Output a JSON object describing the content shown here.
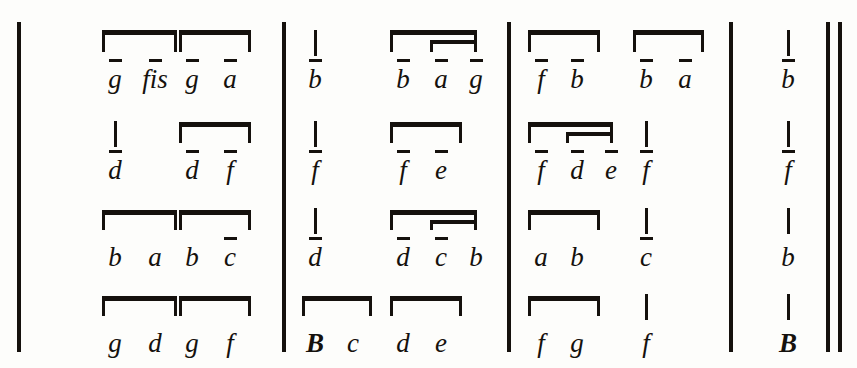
{
  "document": {
    "type": "music-notation-letter-tablature",
    "description": "Four-voice letter notation in four measures plus closing measure, with beam groups and octave strokes",
    "ink_color": "#15110d",
    "page_color": "#fdfdfb"
  },
  "barlines": [
    {
      "name": "opening-barline",
      "x": 17,
      "top": 22,
      "height": 330,
      "width": 4
    },
    {
      "name": "barline-1",
      "x": 282,
      "top": 22,
      "height": 330,
      "width": 4
    },
    {
      "name": "barline-2",
      "x": 507,
      "top": 22,
      "height": 330,
      "width": 4
    },
    {
      "name": "barline-3",
      "x": 729,
      "top": 22,
      "height": 330,
      "width": 4
    },
    {
      "name": "final-barline-a",
      "x": 826,
      "top": 22,
      "height": 330,
      "width": 4
    },
    {
      "name": "final-barline-b",
      "x": 838,
      "top": 22,
      "height": 330,
      "width": 4
    }
  ],
  "voices": [
    {
      "name": "voice-1",
      "baseline": 88,
      "notes": [
        {
          "letter": "g",
          "x": 95,
          "octave": true,
          "stem": true
        },
        {
          "letter": "fis",
          "x": 135,
          "octave": true,
          "stem": true
        },
        {
          "letter": "g",
          "x": 172,
          "octave": true,
          "stem": true
        },
        {
          "letter": "a",
          "x": 210,
          "octave": true,
          "stem": true
        },
        {
          "letter": "b",
          "x": 295,
          "octave": true,
          "stem": true
        },
        {
          "letter": "b",
          "x": 383,
          "octave": true,
          "stem": true
        },
        {
          "letter": "a",
          "x": 421,
          "octave": true,
          "stem": true
        },
        {
          "letter": "g",
          "x": 456,
          "octave": true,
          "stem": true
        },
        {
          "letter": "f",
          "x": 521,
          "octave": true,
          "stem": true
        },
        {
          "letter": "b",
          "x": 557,
          "octave": true,
          "stem": true
        },
        {
          "letter": "b",
          "x": 626,
          "octave": true,
          "stem": true
        },
        {
          "letter": "a",
          "x": 665,
          "octave": true,
          "stem": true
        },
        {
          "letter": "b",
          "x": 768,
          "octave": true,
          "stem": true
        }
      ],
      "beams": [
        {
          "x": 102,
          "width": 75,
          "y": 30,
          "level": 1
        },
        {
          "x": 179,
          "width": 72,
          "y": 30,
          "level": 1
        },
        {
          "x": 390,
          "width": 87,
          "y": 30,
          "level": 1
        },
        {
          "x": 430,
          "width": 47,
          "y": 40,
          "level": 2
        },
        {
          "x": 528,
          "width": 72,
          "y": 30,
          "level": 1
        },
        {
          "x": 633,
          "width": 71,
          "y": 30,
          "level": 1
        }
      ]
    },
    {
      "name": "voice-2",
      "baseline": 179,
      "notes": [
        {
          "letter": "d",
          "x": 95,
          "octave": true,
          "stem": true
        },
        {
          "letter": "d",
          "x": 172,
          "octave": true,
          "stem": true
        },
        {
          "letter": "f",
          "x": 210,
          "octave": true,
          "stem": true
        },
        {
          "letter": "f",
          "x": 295,
          "octave": true,
          "stem": true
        },
        {
          "letter": "f",
          "x": 383,
          "octave": true,
          "stem": true
        },
        {
          "letter": "e",
          "x": 421,
          "octave": true,
          "stem": true
        },
        {
          "letter": "f",
          "x": 521,
          "octave": true,
          "stem": true
        },
        {
          "letter": "d",
          "x": 557,
          "octave": true,
          "stem": true
        },
        {
          "letter": "e",
          "x": 591,
          "octave": true,
          "stem": true
        },
        {
          "letter": "f",
          "x": 626,
          "octave": true,
          "stem": true
        },
        {
          "letter": "f",
          "x": 768,
          "octave": true,
          "stem": true
        }
      ],
      "beams": [
        {
          "x": 179,
          "width": 72,
          "y": 122,
          "level": 1
        },
        {
          "x": 390,
          "width": 72,
          "y": 122,
          "level": 1
        },
        {
          "x": 528,
          "width": 85,
          "y": 122,
          "level": 1
        },
        {
          "x": 566,
          "width": 47,
          "y": 132,
          "level": 2
        }
      ]
    },
    {
      "name": "voice-3",
      "baseline": 266,
      "notes": [
        {
          "letter": "b",
          "x": 95,
          "octave": false,
          "stem": true
        },
        {
          "letter": "a",
          "x": 135,
          "octave": false,
          "stem": true
        },
        {
          "letter": "b",
          "x": 172,
          "octave": false,
          "stem": true
        },
        {
          "letter": "c",
          "x": 210,
          "octave": true,
          "stem": true
        },
        {
          "letter": "d",
          "x": 295,
          "octave": true,
          "stem": true
        },
        {
          "letter": "d",
          "x": 383,
          "octave": true,
          "stem": true
        },
        {
          "letter": "c",
          "x": 421,
          "octave": true,
          "stem": true
        },
        {
          "letter": "b",
          "x": 456,
          "octave": false,
          "stem": true
        },
        {
          "letter": "a",
          "x": 521,
          "octave": false,
          "stem": true
        },
        {
          "letter": "b",
          "x": 557,
          "octave": false,
          "stem": true
        },
        {
          "letter": "c",
          "x": 626,
          "octave": true,
          "stem": true
        },
        {
          "letter": "b",
          "x": 768,
          "octave": false,
          "stem": true
        }
      ],
      "beams": [
        {
          "x": 102,
          "width": 75,
          "y": 210,
          "level": 1
        },
        {
          "x": 179,
          "width": 72,
          "y": 210,
          "level": 1
        },
        {
          "x": 390,
          "width": 87,
          "y": 210,
          "level": 1
        },
        {
          "x": 430,
          "width": 47,
          "y": 220,
          "level": 2
        },
        {
          "x": 528,
          "width": 72,
          "y": 210,
          "level": 1
        }
      ]
    },
    {
      "name": "voice-4",
      "baseline": 352,
      "notes": [
        {
          "letter": "g",
          "x": 95,
          "octave": false,
          "stem": true
        },
        {
          "letter": "d",
          "x": 135,
          "octave": false,
          "stem": true
        },
        {
          "letter": "g",
          "x": 172,
          "octave": false,
          "stem": true
        },
        {
          "letter": "f",
          "x": 210,
          "octave": false,
          "stem": true
        },
        {
          "letter": "B",
          "x": 295,
          "octave": false,
          "stem": true,
          "capital": true
        },
        {
          "letter": "c",
          "x": 333,
          "octave": false,
          "stem": true
        },
        {
          "letter": "d",
          "x": 383,
          "octave": false,
          "stem": true
        },
        {
          "letter": "e",
          "x": 421,
          "octave": false,
          "stem": true
        },
        {
          "letter": "f",
          "x": 521,
          "octave": false,
          "stem": true
        },
        {
          "letter": "g",
          "x": 557,
          "octave": false,
          "stem": true
        },
        {
          "letter": "f",
          "x": 626,
          "octave": false,
          "stem": true
        },
        {
          "letter": "B",
          "x": 768,
          "octave": false,
          "stem": true,
          "capital": true
        }
      ],
      "beams": [
        {
          "x": 102,
          "width": 75,
          "y": 296,
          "level": 1
        },
        {
          "x": 179,
          "width": 72,
          "y": 296,
          "level": 1
        },
        {
          "x": 302,
          "width": 70,
          "y": 296,
          "level": 1
        },
        {
          "x": 390,
          "width": 72,
          "y": 296,
          "level": 1
        },
        {
          "x": 528,
          "width": 72,
          "y": 296,
          "level": 1
        }
      ]
    }
  ]
}
